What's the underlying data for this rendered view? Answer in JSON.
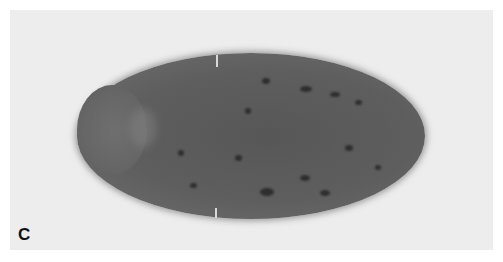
{
  "figure": {
    "panel_label": "C",
    "colors": {
      "background": "#ededed",
      "specimen": "#5e5e5e",
      "stain_spots": "#2e2e2e"
    }
  }
}
